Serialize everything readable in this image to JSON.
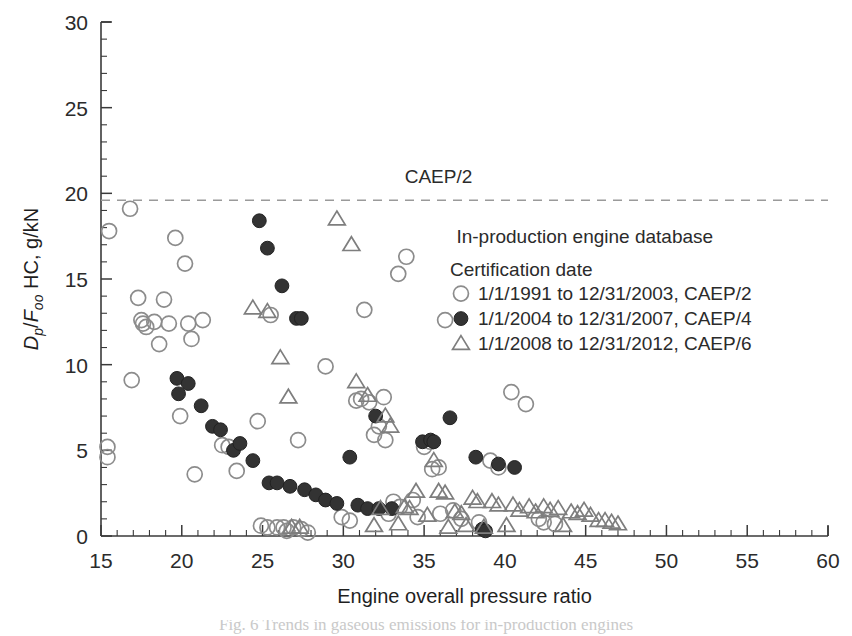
{
  "figure": {
    "background": "#ffffff",
    "caption_sliver": "Fig. 6  Trends in gaseous emissions for in-production engines"
  },
  "chart_data": {
    "type": "scatter",
    "title": "",
    "xlabel": "Engine overall pressure ratio",
    "ylabel": "Dp/Foo HC, g/kN",
    "ylabel_parts": {
      "d": "D",
      "p_sub": "p",
      "slash": "/",
      "f": "F",
      "oo_sub": "oo",
      "rest": " HC, g/kN"
    },
    "xlim": [
      15,
      60
    ],
    "ylim": [
      0,
      30
    ],
    "xticks": [
      15,
      20,
      25,
      30,
      35,
      40,
      45,
      50,
      55,
      60
    ],
    "yticks": [
      0,
      5,
      10,
      15,
      20,
      25,
      30
    ],
    "x_minor_step": 1,
    "y_minor_step": 1,
    "grid": false,
    "annotations": [
      {
        "name": "caep2-reference-label",
        "text": "CAEP/2",
        "x": 33.8,
        "y": 20.6
      },
      {
        "name": "database-title",
        "text": "In-production engine database",
        "x": 37.0,
        "y": 17.1
      }
    ],
    "reference_lines": [
      {
        "name": "caep2-limit",
        "label": "CAEP/2",
        "y": 19.6,
        "style": "dashed",
        "color": "#9a9a9a"
      }
    ],
    "legend": {
      "position": "inside-right",
      "title": "Certification date",
      "entries": [
        {
          "marker": "open-circle",
          "label": "1/1/1991 to 12/31/2003, CAEP/2",
          "color": "#8c8c8c"
        },
        {
          "marker": "filled-circle",
          "label": "1/1/2004 to 12/31/2007, CAEP/4",
          "color": "#333333"
        },
        {
          "marker": "open-triangle",
          "label": "1/1/2008 to 12/31/2012, CAEP/6",
          "color": "#7e7e7e"
        }
      ]
    },
    "series": [
      {
        "name": "1/1/1991 to 12/31/2003, CAEP/2",
        "marker": "open-circle",
        "color": "#8c8c8c",
        "points": [
          [
            15.4,
            5.2
          ],
          [
            15.4,
            4.6
          ],
          [
            15.5,
            17.8
          ],
          [
            16.8,
            19.1
          ],
          [
            16.9,
            9.1
          ],
          [
            17.3,
            13.9
          ],
          [
            17.5,
            12.6
          ],
          [
            17.6,
            12.4
          ],
          [
            17.8,
            12.2
          ],
          [
            18.3,
            12.5
          ],
          [
            18.6,
            11.2
          ],
          [
            18.9,
            13.8
          ],
          [
            19.2,
            12.4
          ],
          [
            19.6,
            17.4
          ],
          [
            19.9,
            7.0
          ],
          [
            20.2,
            15.9
          ],
          [
            20.4,
            12.4
          ],
          [
            20.6,
            11.5
          ],
          [
            20.8,
            3.6
          ],
          [
            21.3,
            12.6
          ],
          [
            22.5,
            5.3
          ],
          [
            22.9,
            5.2
          ],
          [
            23.4,
            3.8
          ],
          [
            24.7,
            6.7
          ],
          [
            24.9,
            0.6
          ],
          [
            25.3,
            0.5
          ],
          [
            25.5,
            12.9
          ],
          [
            25.9,
            0.5
          ],
          [
            26.3,
            0.5
          ],
          [
            26.5,
            0.3
          ],
          [
            26.9,
            0.5
          ],
          [
            27.2,
            5.6
          ],
          [
            27.4,
            0.4
          ],
          [
            27.8,
            0.2
          ],
          [
            28.9,
            9.9
          ],
          [
            29.9,
            1.1
          ],
          [
            30.4,
            0.9
          ],
          [
            30.8,
            7.9
          ],
          [
            31.1,
            8.0
          ],
          [
            31.3,
            13.2
          ],
          [
            31.6,
            7.8
          ],
          [
            31.9,
            5.9
          ],
          [
            32.2,
            6.4
          ],
          [
            32.5,
            8.1
          ],
          [
            32.6,
            5.6
          ],
          [
            32.8,
            1.3
          ],
          [
            33.1,
            2.0
          ],
          [
            33.4,
            15.3
          ],
          [
            33.5,
            1.7
          ],
          [
            33.9,
            16.3
          ],
          [
            34.3,
            2.1
          ],
          [
            34.6,
            1.1
          ],
          [
            35.0,
            5.2
          ],
          [
            35.4,
            5.5
          ],
          [
            35.5,
            3.9
          ],
          [
            35.9,
            4.0
          ],
          [
            36.0,
            1.3
          ],
          [
            36.3,
            12.6
          ],
          [
            36.8,
            1.5
          ],
          [
            37.3,
            1.0
          ],
          [
            38.4,
            0.8
          ],
          [
            39.1,
            4.4
          ],
          [
            39.6,
            4.0
          ],
          [
            40.4,
            8.4
          ],
          [
            41.3,
            7.7
          ],
          [
            42.1,
            1.0
          ],
          [
            42.4,
            0.8
          ],
          [
            43.1,
            0.7
          ]
        ]
      },
      {
        "name": "1/1/2004 to 12/31/2007, CAEP/4",
        "marker": "filled-circle",
        "color": "#333333",
        "points": [
          [
            19.7,
            9.2
          ],
          [
            19.8,
            8.3
          ],
          [
            20.4,
            8.9
          ],
          [
            21.2,
            7.6
          ],
          [
            21.9,
            6.4
          ],
          [
            22.4,
            6.2
          ],
          [
            23.2,
            5.0
          ],
          [
            23.6,
            5.4
          ],
          [
            24.4,
            4.4
          ],
          [
            24.8,
            18.4
          ],
          [
            25.3,
            16.8
          ],
          [
            25.4,
            3.1
          ],
          [
            25.9,
            3.1
          ],
          [
            26.2,
            14.6
          ],
          [
            26.7,
            2.9
          ],
          [
            27.1,
            12.7
          ],
          [
            27.4,
            12.7
          ],
          [
            27.6,
            2.7
          ],
          [
            28.3,
            2.4
          ],
          [
            28.9,
            2.1
          ],
          [
            29.6,
            1.9
          ],
          [
            30.4,
            4.6
          ],
          [
            30.9,
            1.8
          ],
          [
            31.5,
            1.6
          ],
          [
            32.0,
            7.0
          ],
          [
            32.2,
            1.6
          ],
          [
            33.0,
            1.6
          ],
          [
            34.9,
            5.5
          ],
          [
            35.4,
            5.6
          ],
          [
            35.6,
            5.5
          ],
          [
            36.6,
            6.9
          ],
          [
            38.2,
            4.6
          ],
          [
            38.6,
            0.4
          ],
          [
            38.8,
            0.3
          ],
          [
            39.6,
            4.2
          ],
          [
            40.6,
            4.0
          ]
        ]
      },
      {
        "name": "1/1/2008 to 12/31/2012, CAEP/6",
        "marker": "open-triangle",
        "color": "#7e7e7e",
        "points": [
          [
            24.4,
            13.3
          ],
          [
            25.3,
            13.1
          ],
          [
            26.1,
            10.4
          ],
          [
            26.6,
            8.1
          ],
          [
            26.8,
            0.5
          ],
          [
            27.3,
            0.5
          ],
          [
            29.6,
            18.5
          ],
          [
            30.5,
            17.0
          ],
          [
            30.8,
            9.0
          ],
          [
            31.5,
            8.2
          ],
          [
            31.9,
            0.6
          ],
          [
            32.3,
            1.6
          ],
          [
            32.6,
            7.0
          ],
          [
            32.9,
            6.4
          ],
          [
            33.4,
            0.7
          ],
          [
            33.8,
            1.7
          ],
          [
            34.1,
            1.6
          ],
          [
            34.5,
            2.6
          ],
          [
            35.2,
            1.2
          ],
          [
            35.6,
            4.4
          ],
          [
            35.9,
            2.6
          ],
          [
            36.3,
            2.5
          ],
          [
            36.5,
            0.5
          ],
          [
            36.9,
            1.4
          ],
          [
            37.3,
            1.3
          ],
          [
            37.6,
            0.6
          ],
          [
            38.0,
            2.2
          ],
          [
            38.3,
            2.0
          ],
          [
            38.7,
            0.5
          ],
          [
            39.2,
            2.0
          ],
          [
            39.6,
            1.8
          ],
          [
            40.1,
            0.6
          ],
          [
            40.5,
            1.8
          ],
          [
            40.9,
            1.5
          ],
          [
            41.5,
            1.7
          ],
          [
            41.9,
            1.4
          ],
          [
            42.4,
            1.7
          ],
          [
            42.8,
            1.5
          ],
          [
            43.3,
            1.6
          ],
          [
            43.6,
            0.6
          ],
          [
            44.1,
            1.4
          ],
          [
            44.5,
            1.3
          ],
          [
            44.9,
            1.5
          ],
          [
            45.3,
            1.2
          ],
          [
            45.8,
            0.9
          ],
          [
            46.2,
            0.9
          ],
          [
            46.6,
            0.8
          ],
          [
            47.0,
            0.7
          ]
        ]
      }
    ]
  }
}
